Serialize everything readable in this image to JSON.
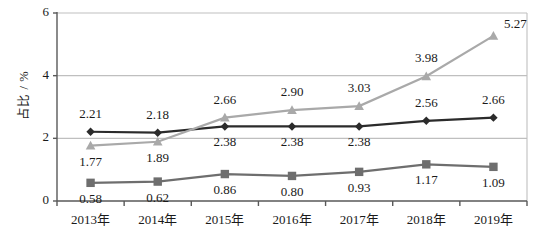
{
  "chart_data": {
    "type": "line",
    "title": "",
    "xlabel": "",
    "ylabel": "占比 / %",
    "categories": [
      "2013年",
      "2014年",
      "2015年",
      "2016年",
      "2017年",
      "2018年",
      "2019年"
    ],
    "ylim": [
      0,
      6
    ],
    "yticks": [
      "0",
      "2",
      "4",
      "6"
    ],
    "ytick_values": [
      0,
      2,
      4,
      6
    ],
    "grid": "horizontal",
    "legend": "none",
    "series": [
      {
        "name": "series-diamond",
        "marker": "diamond",
        "color": "#2b2b2b",
        "values": [
          2.21,
          2.18,
          2.38,
          2.38,
          2.38,
          2.56,
          2.66
        ],
        "labels": [
          "2.21",
          "2.18",
          "2.38",
          "2.38",
          "2.38",
          "2.56",
          "2.66"
        ],
        "label_positions": [
          "above",
          "above",
          "below",
          "below",
          "below",
          "above",
          "above"
        ]
      },
      {
        "name": "series-triangle",
        "marker": "triangle",
        "color": "#a9a9a9",
        "values": [
          1.77,
          1.89,
          2.66,
          2.9,
          3.03,
          3.98,
          5.27
        ],
        "labels": [
          "1.77",
          "1.89",
          "2.66",
          "2.90",
          "3.03",
          "3.98",
          "5.27"
        ],
        "label_positions": [
          "below",
          "below",
          "above",
          "above",
          "above",
          "above",
          "above-right"
        ]
      },
      {
        "name": "series-square",
        "marker": "square",
        "color": "#6e6e6e",
        "values": [
          0.58,
          0.62,
          0.86,
          0.8,
          0.93,
          1.17,
          1.09
        ],
        "labels": [
          "0.58",
          "0.62",
          "0.86",
          "0.80",
          "0.93",
          "1.17",
          "1.09"
        ],
        "label_positions": [
          "below",
          "below",
          "below",
          "below",
          "below",
          "below",
          "below"
        ]
      }
    ],
    "colors": {
      "gridline": "#bfbfbf",
      "axis": "#595959",
      "plot_border": "#bfbfbf",
      "background": "#ffffff",
      "text": "#1a1a1a"
    }
  }
}
